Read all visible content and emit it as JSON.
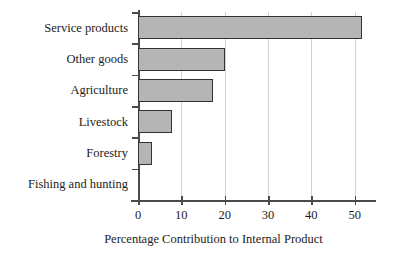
{
  "chart_data": {
    "type": "bar",
    "orientation": "horizontal",
    "title": "",
    "subtitle": "",
    "xlabel": "Percentage Contribution to Internal Product",
    "ylabel": "",
    "categories": [
      "Service products",
      "Other goods",
      "Agriculture",
      "Livestock",
      "Forestry",
      "Fishing and hunting"
    ],
    "values": [
      51.6,
      20.1,
      17.4,
      7.9,
      3.2,
      0
    ],
    "xlim": [
      0,
      54
    ],
    "ylim": [
      0,
      6
    ],
    "xticks": [
      0,
      10,
      20,
      30,
      40,
      50
    ],
    "xtick_labels": [
      "0",
      "10",
      "20",
      "30",
      "40",
      "50"
    ],
    "grid": "vertical-light",
    "legend": "none",
    "bar_fill": "#b5b5b5",
    "bar_edge": "#333333",
    "axis_color": "#4a4a4a",
    "gridline_color": "#d2d2d2",
    "background": "#ffffff"
  }
}
